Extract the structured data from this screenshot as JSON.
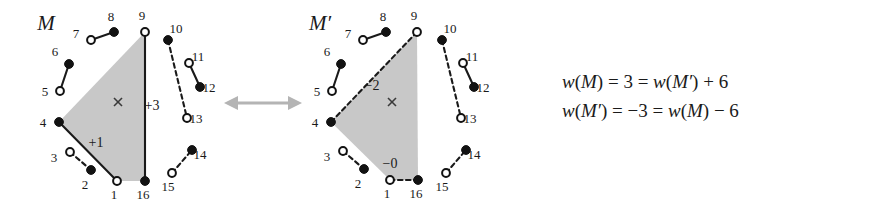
{
  "figure": {
    "caption_free": true,
    "colors": {
      "region_fill": "#c8c8c8",
      "edge": "#1a1a1a",
      "arrow": "#b4b4b4",
      "background": "#ffffff"
    },
    "panels": [
      {
        "id": "panel-m",
        "title": "M",
        "region_label": "×",
        "nodes": [
          {
            "id": "1",
            "type": "hollow",
            "label": "1",
            "x": 117,
            "y": 181,
            "label_dx": -3,
            "label_dy": 18
          },
          {
            "id": "2",
            "type": "filled",
            "label": "2",
            "x": 91,
            "y": 170,
            "label_dx": -6,
            "label_dy": 19
          },
          {
            "id": "3",
            "type": "hollow",
            "label": "3",
            "x": 70,
            "y": 152,
            "label_dx": -16,
            "label_dy": 10
          },
          {
            "id": "4",
            "type": "filled",
            "label": "4",
            "x": 59,
            "y": 122,
            "label_dx": -16,
            "label_dy": 5
          },
          {
            "id": "5",
            "type": "hollow",
            "label": "5",
            "x": 60,
            "y": 91,
            "label_dx": -15,
            "label_dy": 5
          },
          {
            "id": "6",
            "type": "filled",
            "label": "6",
            "x": 69,
            "y": 64,
            "label_dx": -14,
            "label_dy": -8
          },
          {
            "id": "7",
            "type": "hollow",
            "label": "7",
            "x": 91,
            "y": 40,
            "label_dx": -15,
            "label_dy": -2
          },
          {
            "id": "8",
            "type": "filled",
            "label": "8",
            "x": 114,
            "y": 32,
            "label_dx": -3,
            "label_dy": -11
          },
          {
            "id": "9",
            "type": "hollow",
            "label": "9",
            "x": 145,
            "y": 32,
            "label_dx": -3,
            "label_dy": -12
          },
          {
            "id": "10",
            "type": "filled",
            "label": "10",
            "x": 168,
            "y": 40,
            "label_dx": 8,
            "label_dy": -7
          },
          {
            "id": "11",
            "type": "hollow",
            "label": "11",
            "x": 189,
            "y": 63,
            "label_dx": 9,
            "label_dy": -2
          },
          {
            "id": "12",
            "type": "filled",
            "label": "12",
            "x": 200,
            "y": 87,
            "label_dx": 9,
            "label_dy": 5
          },
          {
            "id": "13",
            "type": "hollow",
            "label": "13",
            "x": 187,
            "y": 118,
            "label_dx": 9,
            "label_dy": 5
          },
          {
            "id": "14",
            "type": "filled",
            "label": "14",
            "x": 192,
            "y": 150,
            "label_dx": 8,
            "label_dy": 9
          },
          {
            "id": "15",
            "type": "hollow",
            "label": "15",
            "x": 172,
            "y": 173,
            "label_dx": -4,
            "label_dy": 18
          },
          {
            "id": "16",
            "type": "filled",
            "label": "16",
            "x": 145,
            "y": 181,
            "label_dx": -2,
            "label_dy": 18
          }
        ],
        "edges": [
          {
            "from": "5",
            "to": "6",
            "style": "solid"
          },
          {
            "from": "7",
            "to": "8",
            "style": "solid"
          },
          {
            "from": "9",
            "to": "16",
            "style": "solid"
          },
          {
            "from": "4",
            "to": "1",
            "style": "solid"
          },
          {
            "from": "3",
            "to": "2",
            "style": "dashed"
          },
          {
            "from": "10",
            "to": "13",
            "style": "dashed"
          },
          {
            "from": "11",
            "to": "12",
            "style": "solid"
          },
          {
            "from": "15",
            "to": "14",
            "style": "dashed"
          }
        ],
        "region": {
          "points": "59,122 145,32 145,181 117,181"
        },
        "cross": {
          "x": 118,
          "y": 102
        },
        "edge_weights": [
          {
            "text": "+1",
            "x": 96,
            "y": 147
          },
          {
            "text": "+3",
            "x": 152,
            "y": 110
          }
        ],
        "title_pos": {
          "x": 46,
          "y": 30
        }
      },
      {
        "id": "panel-m-prime",
        "title": "M′",
        "region_label": "×",
        "nodes": [
          {
            "id": "1",
            "type": "hollow",
            "label": "1",
            "x": 390,
            "y": 180,
            "label_dx": -3,
            "label_dy": 18
          },
          {
            "id": "2",
            "type": "filled",
            "label": "2",
            "x": 364,
            "y": 169,
            "label_dx": -6,
            "label_dy": 19
          },
          {
            "id": "3",
            "type": "hollow",
            "label": "3",
            "x": 343,
            "y": 151,
            "label_dx": -16,
            "label_dy": 10
          },
          {
            "id": "4",
            "type": "filled",
            "label": "4",
            "x": 331,
            "y": 122,
            "label_dx": -16,
            "label_dy": 5
          },
          {
            "id": "5",
            "type": "hollow",
            "label": "5",
            "x": 332,
            "y": 91,
            "label_dx": -15,
            "label_dy": 5
          },
          {
            "id": "6",
            "type": "filled",
            "label": "6",
            "x": 341,
            "y": 64,
            "label_dx": -14,
            "label_dy": -8
          },
          {
            "id": "7",
            "type": "hollow",
            "label": "7",
            "x": 363,
            "y": 40,
            "label_dx": -15,
            "label_dy": -2
          },
          {
            "id": "8",
            "type": "filled",
            "label": "8",
            "x": 386,
            "y": 32,
            "label_dx": -3,
            "label_dy": -11
          },
          {
            "id": "9",
            "type": "hollow",
            "label": "9",
            "x": 417,
            "y": 32,
            "label_dx": -3,
            "label_dy": -12
          },
          {
            "id": "10",
            "type": "filled",
            "label": "10",
            "x": 442,
            "y": 40,
            "label_dx": 8,
            "label_dy": -7
          },
          {
            "id": "11",
            "type": "hollow",
            "label": "11",
            "x": 463,
            "y": 63,
            "label_dx": 9,
            "label_dy": -2
          },
          {
            "id": "12",
            "type": "filled",
            "label": "12",
            "x": 474,
            "y": 87,
            "label_dx": 9,
            "label_dy": 5
          },
          {
            "id": "13",
            "type": "hollow",
            "label": "13",
            "x": 461,
            "y": 118,
            "label_dx": 9,
            "label_dy": 5
          },
          {
            "id": "14",
            "type": "filled",
            "label": "14",
            "x": 466,
            "y": 150,
            "label_dx": 8,
            "label_dy": 9
          },
          {
            "id": "15",
            "type": "hollow",
            "label": "15",
            "x": 446,
            "y": 173,
            "label_dx": -4,
            "label_dy": 18
          },
          {
            "id": "16",
            "type": "filled",
            "label": "16",
            "x": 418,
            "y": 180,
            "label_dx": -2,
            "label_dy": 18
          }
        ],
        "edges": [
          {
            "from": "5",
            "to": "6",
            "style": "solid"
          },
          {
            "from": "7",
            "to": "8",
            "style": "solid"
          },
          {
            "from": "4",
            "to": "9",
            "style": "dashed"
          },
          {
            "from": "1",
            "to": "16",
            "style": "dashed"
          },
          {
            "from": "3",
            "to": "2",
            "style": "dashed"
          },
          {
            "from": "10",
            "to": "13",
            "style": "dashed"
          },
          {
            "from": "11",
            "to": "12",
            "style": "solid"
          },
          {
            "from": "15",
            "to": "14",
            "style": "dashed"
          }
        ],
        "region": {
          "points": "331,122 417,32 418,180 390,180"
        },
        "cross": {
          "x": 392,
          "y": 102
        },
        "edge_weights": [
          {
            "text": "−2",
            "x": 372,
            "y": 90
          },
          {
            "text": "−0",
            "x": 390,
            "y": 168
          }
        ],
        "title_pos": {
          "x": 320,
          "y": 30
        }
      }
    ],
    "swap_arrow": {
      "name": "bidirectional-swap-arrow",
      "x1": 224,
      "x2": 302,
      "y": 103
    },
    "equations": [
      "w(M) = 3 = w(M′) + 6",
      "w(M′) = −3 = w(M) − 6"
    ],
    "equations_pos": {
      "x": 562,
      "y": 88,
      "line_gap": 29
    }
  }
}
